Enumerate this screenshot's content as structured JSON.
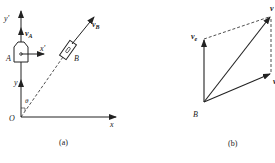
{
  "figure": {
    "panel_a": {
      "caption": "(a)",
      "origin_label": "O",
      "x_axis_label": "x",
      "y_axis_label": "y",
      "moving_x_label": "x'",
      "moving_y_label": "y'",
      "body_a_label": "A",
      "body_b_label": "B",
      "velocity_a_label": "v",
      "velocity_a_sub": "A",
      "velocity_b_label": "v",
      "velocity_b_sub": "B",
      "angle_label": "θ"
    },
    "panel_b": {
      "caption": "(b)",
      "point_label": "B",
      "velocity_e_label": "v",
      "velocity_e_sub": "e",
      "velocity_abs_label": "v",
      "velocity_r_label": "v"
    },
    "colors": {
      "stroke": "#222222",
      "background": "#ffffff"
    }
  }
}
